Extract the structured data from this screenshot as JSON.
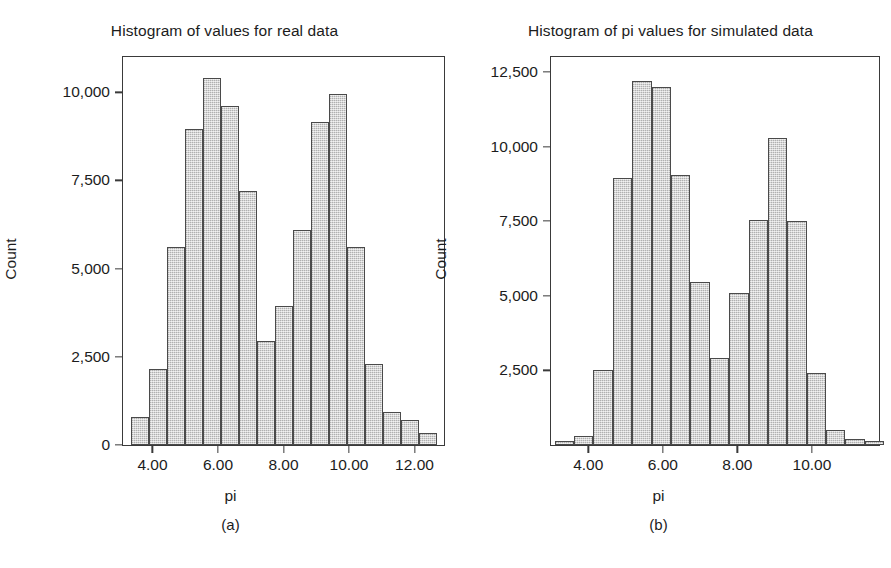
{
  "figure": {
    "background": "#ffffff",
    "bar_fill": "#c9c9c9",
    "bar_edge": "#4a4a4a",
    "axis_color": "#3a3a3a"
  },
  "panels": [
    {
      "caption": "(a)",
      "chart_data": {
        "type": "bar",
        "title": "Histogram of values for real data",
        "xlabel": "pi",
        "ylabel": "Count",
        "grid": false,
        "legend": false,
        "xlim": [
          3.1,
          12.9
        ],
        "ylim": [
          0,
          11000
        ],
        "xticks": [
          4.0,
          6.0,
          8.0,
          10.0,
          12.0
        ],
        "xtick_labels": [
          "4.00",
          "6.00",
          "8.00",
          "10.00",
          "12.00"
        ],
        "yticks": [
          0,
          2500,
          5000,
          7500,
          10000
        ],
        "ytick_labels": [
          "0",
          "2,500",
          "5,000",
          "7,500",
          "10,000"
        ],
        "bin_width": 0.55,
        "bin_left_edges": [
          3.35,
          3.9,
          4.45,
          5.0,
          5.55,
          6.1,
          6.65,
          7.2,
          7.75,
          8.3,
          8.85,
          9.4,
          9.95,
          10.5,
          11.05,
          11.6,
          12.15
        ],
        "categories": [
          "3.35-3.90",
          "3.90-4.45",
          "4.45-5.00",
          "5.00-5.55",
          "5.55-6.10",
          "6.10-6.65",
          "6.65-7.20",
          "7.20-7.75",
          "7.75-8.30",
          "8.30-8.85",
          "8.85-9.40",
          "9.40-9.95",
          "9.95-10.50",
          "10.50-11.05",
          "11.05-11.60",
          "11.60-12.15",
          "12.15-12.70"
        ],
        "values": [
          800,
          2150,
          5600,
          8950,
          10400,
          9600,
          7200,
          2950,
          3950,
          6100,
          9150,
          9950,
          5600,
          2300,
          950,
          700,
          350
        ]
      }
    },
    {
      "caption": "(b)",
      "chart_data": {
        "type": "bar",
        "title": "Histogram of pi values for simulated data",
        "xlabel": "pi",
        "ylabel": "Count",
        "grid": false,
        "legend": false,
        "xlim": [
          3.0,
          11.8
        ],
        "ylim": [
          0,
          13000
        ],
        "xticks": [
          4.0,
          6.0,
          8.0,
          10.0
        ],
        "xtick_labels": [
          "4.00",
          "6.00",
          "8.00",
          "10.00"
        ],
        "yticks": [
          2500,
          5000,
          7500,
          10000,
          12500
        ],
        "ytick_labels": [
          "2,500",
          "5,000",
          "7,500",
          "10,000",
          "12,500"
        ],
        "bin_width": 0.52,
        "bin_left_edges": [
          3.1,
          3.62,
          4.14,
          4.66,
          5.18,
          5.7,
          6.22,
          6.74,
          7.26,
          7.78,
          8.3,
          8.82,
          9.34,
          9.86,
          10.38,
          10.9,
          11.42
        ],
        "categories": [
          "3.10-3.62",
          "3.62-4.14",
          "4.14-4.66",
          "4.66-5.18",
          "5.18-5.70",
          "5.70-6.22",
          "6.22-6.74",
          "6.74-7.26",
          "7.26-7.78",
          "7.78-8.30",
          "8.30-8.82",
          "8.82-9.34",
          "9.34-9.86",
          "9.86-10.38",
          "10.38-10.90",
          "10.90-11.42",
          "11.42-11.94"
        ],
        "values": [
          120,
          300,
          2500,
          8950,
          12200,
          12000,
          9050,
          5450,
          2900,
          5100,
          7550,
          10300,
          7500,
          2400,
          500,
          200,
          120
        ]
      }
    }
  ]
}
